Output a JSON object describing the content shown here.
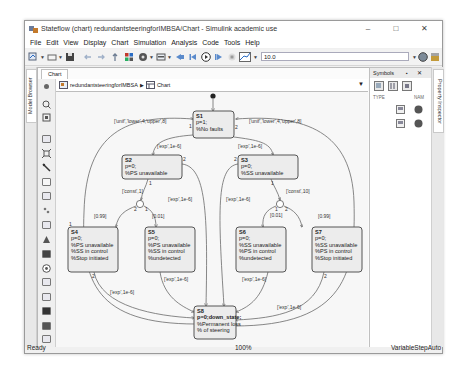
{
  "window": {
    "title": "Stateflow (chart) redundantsteeringforIMBSA/Chart - Simulink academic use",
    "controls": {
      "minimize": "–",
      "maximize": "□",
      "close": "✕"
    }
  },
  "menubar": {
    "items": [
      "File",
      "Edit",
      "View",
      "Display",
      "Chart",
      "Simulation",
      "Analysis",
      "Code",
      "Tools",
      "Help"
    ]
  },
  "toolbar": {
    "stop_time": "10.0",
    "icons": [
      "model-settings-icon",
      "open-icon",
      "save-icon",
      "back-icon",
      "forward-icon",
      "up-icon",
      "library-icon",
      "settings-gear-icon",
      "block-icon",
      "step-back-icon",
      "step-icon",
      "run-icon",
      "step-forward-icon",
      "stop-icon",
      "scope-icon",
      "check-icon",
      "build-icon"
    ]
  },
  "left_tabs": {
    "model_browser": "Model Browser"
  },
  "right_tabs": {
    "property_inspector": "Property Inspector"
  },
  "editor": {
    "tab_label": "Chart",
    "breadcrumb": {
      "model": "redundantsteeringforIMBSA",
      "separator": "▶",
      "chart": "Chart"
    }
  },
  "symbols_panel": {
    "title": "Symbols",
    "columns": [
      "TYPE",
      "NAM"
    ]
  },
  "diagram": {
    "states": [
      {
        "id": "S1",
        "lines": [
          "p=1;",
          "%No faults"
        ]
      },
      {
        "id": "S2",
        "lines": [
          "p=0;",
          "%PS unavailable"
        ]
      },
      {
        "id": "S3",
        "lines": [
          "p=0;",
          "%SS unavailable"
        ]
      },
      {
        "id": "S4",
        "lines": [
          "p=0;",
          "%PS unavailable",
          "%SS in control",
          "%Stop initiated"
        ]
      },
      {
        "id": "S5",
        "lines": [
          "p=0;",
          "%PS unavailable",
          "%SS in control",
          "%undetected"
        ]
      },
      {
        "id": "S6",
        "lines": [
          "p=0;",
          "%SS unavailable",
          "%PS in control",
          "%undetected"
        ]
      },
      {
        "id": "S7",
        "lines": [
          "p=0;",
          "%SS unavailable",
          "%PS in control",
          "%Stop initiated"
        ]
      },
      {
        "id": "S8",
        "lines": [
          "p=0;down_state;",
          "%Permanent loss",
          "% of steering"
        ]
      }
    ],
    "transitions": {
      "unif_left": "['unif','lower',4,'upper',8]",
      "unif_right": "['unif','lower',4,'upper',8]",
      "s1_s2": "['exp',1e-6]",
      "s1_s3": "['exp',1e-6]",
      "s2_const": "['const',1]",
      "s3_const": "['const',10]",
      "s2_s8": "['exp',1e-6]",
      "s3_s8": "['exp',1e-6]",
      "p_s4": "[0.99]",
      "p_s5": "[0.01]",
      "p_s6": "[0.01]",
      "p_s7": "[0.99]",
      "s5_s8": "['exp',1e-6]",
      "s6_s8": "['exp',1e-6]",
      "s4_s8": "['exp',1e-6]",
      "s7_s8": "['exp',1e-6]"
    },
    "order_labels": {
      "one": "1",
      "two": "2"
    }
  },
  "statusbar": {
    "status": "Ready",
    "zoom": "100%",
    "solver": "VariableStepAuto"
  }
}
